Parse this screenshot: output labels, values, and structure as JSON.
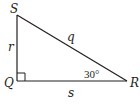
{
  "figure": {
    "type": "right-triangle",
    "colors": {
      "stroke": "#231f20",
      "background": "#ffffff"
    },
    "vertices": {
      "S": {
        "label": "S",
        "x": 17,
        "y": 15
      },
      "Q": {
        "label": "Q",
        "x": 17,
        "y": 81
      },
      "R": {
        "label": "R",
        "x": 127,
        "y": 81
      }
    },
    "sides": {
      "SQ": {
        "label": "r"
      },
      "SR": {
        "label": "q"
      },
      "QR": {
        "label": "s"
      }
    },
    "angles": {
      "R": {
        "label": "30°"
      },
      "Q": {
        "marker": "right-angle"
      }
    }
  }
}
